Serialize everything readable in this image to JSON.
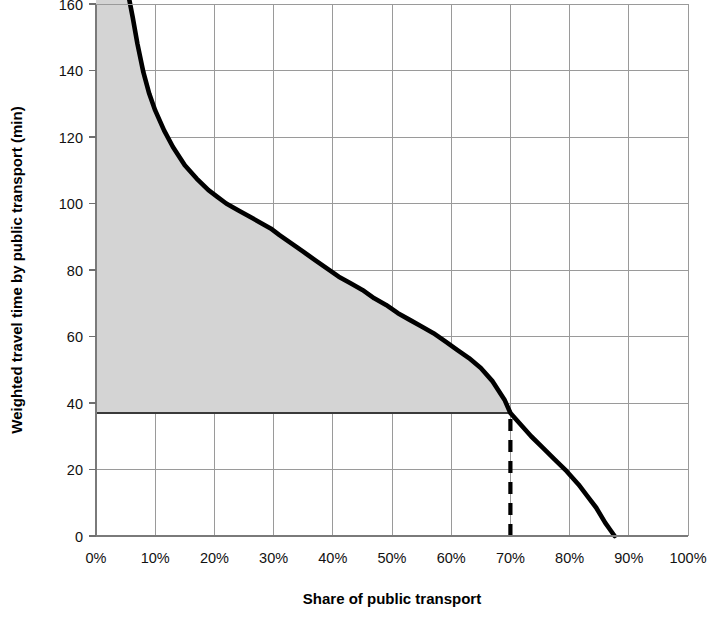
{
  "chart_data": {
    "type": "line",
    "title": "",
    "subtitle": "",
    "xlabel": "Share of public transport",
    "ylabel": "Weighted travel time by public transport (min)",
    "xlim": [
      0,
      100
    ],
    "ylim": [
      0,
      163
    ],
    "grid": true,
    "legend": "none",
    "x_tick_labels": [
      "0%",
      "10%",
      "20%",
      "30%",
      "40%",
      "50%",
      "60%",
      "70%",
      "80%",
      "90%",
      "100%"
    ],
    "x_tick_values": [
      0,
      10,
      20,
      30,
      40,
      50,
      60,
      70,
      80,
      90,
      100
    ],
    "y_tick_labels": [
      "0",
      "20",
      "40",
      "60",
      "80",
      "100",
      "120",
      "140",
      "160"
    ],
    "y_tick_values": [
      0,
      20,
      40,
      60,
      80,
      100,
      120,
      140,
      160
    ],
    "series": [
      {
        "name": "Weighted travel time by public transport",
        "color": "#000000",
        "fill_color": "#d4d4d4",
        "x": [
          0.0,
          2.0,
          4.0,
          5.0,
          5.6,
          6.2,
          7.0,
          8.0,
          9.0,
          10.0,
          11.5,
          13.0,
          15.0,
          17.0,
          19.0,
          20.5,
          22.0,
          24.0,
          26.0,
          28.0,
          29.5,
          31.0,
          33.0,
          35.0,
          37.0,
          39.0,
          41.0,
          43.0,
          45.0,
          47.0,
          49.0,
          51.0,
          53.0,
          55.0,
          57.0,
          59.0,
          61.0,
          63.0,
          65.0,
          67.0,
          69.0,
          70.0,
          71.5,
          73.5,
          75.5,
          77.5,
          79.5,
          81.5,
          83.0,
          84.5,
          86.0,
          87.0,
          87.6
        ],
        "y": [
          163.0,
          163.0,
          163.0,
          163.0,
          161.5,
          156.0,
          148.0,
          139.5,
          133.0,
          128.0,
          122.0,
          117.0,
          111.5,
          107.5,
          104.0,
          102.0,
          100.0,
          98.0,
          96.0,
          94.0,
          92.5,
          90.5,
          88.0,
          85.5,
          83.0,
          80.5,
          78.0,
          76.0,
          74.0,
          71.5,
          69.5,
          67.0,
          65.0,
          63.0,
          61.0,
          58.5,
          56.0,
          53.5,
          50.5,
          46.5,
          41.0,
          37.0,
          34.0,
          30.0,
          26.5,
          23.0,
          19.5,
          15.5,
          12.0,
          8.5,
          4.0,
          1.5,
          0.0
        ]
      }
    ],
    "annotations": [
      {
        "kind": "vertical-reference-line",
        "style": "dashed",
        "x": 70,
        "y_from": 0,
        "y_to": 37,
        "color": "#000000"
      },
      {
        "kind": "horizontal-reference-line",
        "style": "solid",
        "y": 37,
        "x_from": 0,
        "x_to": 70,
        "color": "#3a3a3a"
      }
    ],
    "shaded_region": {
      "description": "area under the curve above the 37 min reference level",
      "color": "#d4d4d4",
      "y_floor": 37
    }
  },
  "axes": {
    "x": {
      "label": "Share of public transport",
      "ticks": [
        "0%",
        "10%",
        "20%",
        "30%",
        "40%",
        "50%",
        "60%",
        "70%",
        "80%",
        "90%",
        "100%"
      ]
    },
    "y": {
      "label": "Weighted travel time by public transport (min)",
      "ticks": [
        "0",
        "20",
        "40",
        "60",
        "80",
        "100",
        "120",
        "140",
        "160"
      ]
    }
  },
  "colors": {
    "curve": "#000000",
    "area": "#d4d4d4",
    "grid": "#9a9a9a",
    "axis": "#7a7a7a",
    "background": "#ffffff"
  }
}
